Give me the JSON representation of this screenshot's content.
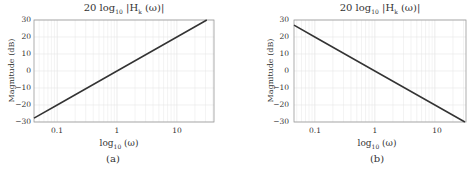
{
  "chart_data": [
    {
      "type": "line",
      "panel": "(a)",
      "title": "20 log10 |Hk(ω)|",
      "title_parts": {
        "pre": "20 log",
        "sub": "10",
        "post": " |H",
        "sub2": "k",
        "post2": " (ω)|"
      },
      "xlabel": "log10 (ω)",
      "xlabel_parts": {
        "pre": "log",
        "sub": "10",
        "post": " (ω)"
      },
      "ylabel": "Magnitude (dB)",
      "xscale": "log",
      "xlim": [
        0.041,
        41.7
      ],
      "ylim": [
        -30,
        30
      ],
      "xticks": [
        0.1,
        1,
        10
      ],
      "xtick_labels": [
        "0.1",
        "1",
        "10"
      ],
      "yticks": [
        -30,
        -20,
        -10,
        0,
        10,
        20,
        30
      ],
      "ytick_labels": [
        "−30",
        "−20",
        "−10",
        "0",
        "10",
        "20",
        "30"
      ],
      "grid": true,
      "series": [
        {
          "name": "magnitude",
          "slope_db_per_decade": 20,
          "x": [
            0.041,
            0.1,
            1,
            10,
            31.6
          ],
          "y": [
            -27.7,
            -20,
            0,
            20,
            30
          ]
        }
      ]
    },
    {
      "type": "line",
      "panel": "(b)",
      "title": "20 log10 |Hk(ω)|",
      "title_parts": {
        "pre": "20 log",
        "sub": "10",
        "post": " |H",
        "sub2": "k",
        "post2": " (ω)|"
      },
      "xlabel": "log10 (ω)",
      "xlabel_parts": {
        "pre": "log",
        "sub": "10",
        "post": " (ω)"
      },
      "ylabel": "Magnitude (dB)",
      "xscale": "log",
      "xlim": [
        0.045,
        33
      ],
      "ylim": [
        -30,
        30
      ],
      "xticks": [
        0.1,
        1,
        10
      ],
      "xtick_labels": [
        "0.1",
        "1",
        "10"
      ],
      "yticks": [
        -30,
        -20,
        -10,
        0,
        10,
        20,
        30
      ],
      "ytick_labels": [
        "−30",
        "−20",
        "−10",
        "0",
        "10",
        "20",
        "30"
      ],
      "grid": true,
      "series": [
        {
          "name": "magnitude",
          "slope_db_per_decade": -20,
          "x": [
            0.045,
            0.1,
            1,
            10,
            31.6
          ],
          "y": [
            27,
            20,
            0,
            -20,
            -30
          ]
        }
      ]
    }
  ],
  "colors": {
    "line": "#333333",
    "grid": "#e6e6e6",
    "axis": "#999999"
  }
}
